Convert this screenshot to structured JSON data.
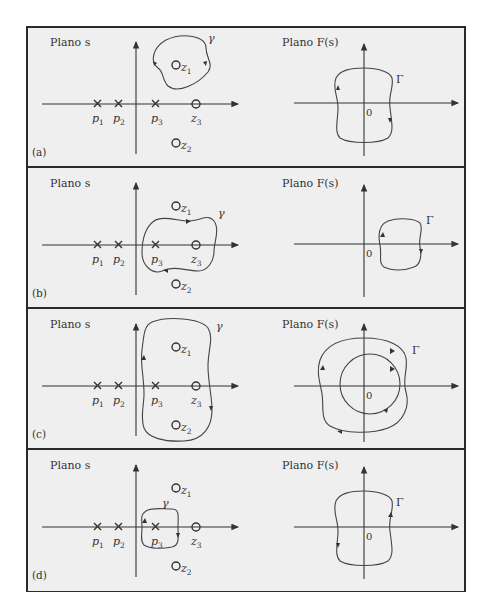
{
  "figure": {
    "s_plane_title": "Plano s",
    "f_plane_title": "Plano F(s)",
    "s_contour_label": "γ",
    "f_contour_label": "Γ",
    "origin_label": "0",
    "poles": [
      {
        "name": "p",
        "sub": "1"
      },
      {
        "name": "p",
        "sub": "2"
      },
      {
        "name": "p",
        "sub": "3"
      }
    ],
    "zeros": [
      {
        "name": "z",
        "sub": "1"
      },
      {
        "name": "z",
        "sub": "2"
      },
      {
        "name": "z",
        "sub": "3"
      }
    ],
    "panels": [
      {
        "tag": "(a)",
        "s_encloses": [
          "z1"
        ],
        "f_encircles_origin": 0,
        "description": "γ encloses z1 only; Γ encircles origin once"
      },
      {
        "tag": "(b)",
        "s_encloses": [
          "p3",
          "z3"
        ],
        "f_encircles_origin": 0,
        "description": "γ encloses p3 and z3; Γ does not encircle origin"
      },
      {
        "tag": "(c)",
        "s_encloses": [
          "z1",
          "z2",
          "p3",
          "z3"
        ],
        "f_encircles_origin": 2,
        "description": "γ encloses z1, z2, p3, z3; Γ encircles origin twice"
      },
      {
        "tag": "(d)",
        "s_encloses": [
          "p3"
        ],
        "f_encircles_origin": -1,
        "description": "γ encloses p3 only; Γ encircles origin in opposite direction"
      }
    ]
  },
  "colors": {
    "background": "#efefef",
    "border": "#2a2a2a",
    "line": "#333333"
  }
}
